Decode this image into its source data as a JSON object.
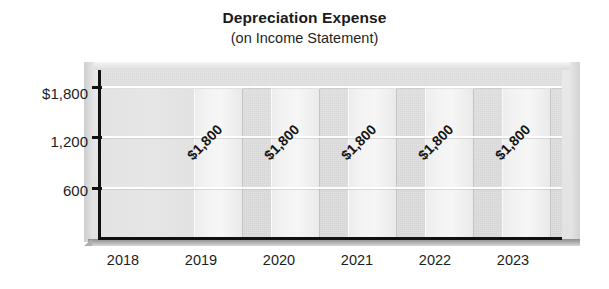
{
  "chart_data": {
    "type": "bar",
    "title": "Depreciation Expense",
    "subtitle": "(on Income Statement)",
    "xlabel": "",
    "ylabel": "",
    "categories": [
      "2018",
      "2019",
      "2020",
      "2021",
      "2022",
      "2023"
    ],
    "values": [
      1800,
      1800,
      1800,
      1800,
      1800,
      1800
    ],
    "point_labels": [
      "",
      "$1,800",
      "$1,800",
      "$1,800",
      "$1,800",
      "$1,800"
    ],
    "ytick_labels": [
      "$1,800",
      "1,200",
      "600"
    ],
    "ytick_values": [
      1800,
      1200,
      600
    ],
    "ylim": [
      0,
      2000
    ],
    "grid": true,
    "legend": false,
    "colors": {
      "bar": "#f2f2f2",
      "plot_background": "#e2e2e2",
      "axis": "#111111",
      "gridline": "#ffffff",
      "text": "#1d1d1d"
    }
  },
  "axes": {
    "y_ticks": [
      {
        "label": "$1,800",
        "top": 85
      },
      {
        "label": "1,200",
        "top": 133
      },
      {
        "label": "600",
        "top": 182
      }
    ],
    "x_ticks": [
      {
        "label": "2018",
        "left": 123
      },
      {
        "label": "2019",
        "left": 201
      },
      {
        "label": "2020",
        "left": 279
      },
      {
        "label": "2021",
        "left": 357
      },
      {
        "label": "2022",
        "left": 435
      },
      {
        "label": "2023",
        "left": 513
      }
    ]
  }
}
